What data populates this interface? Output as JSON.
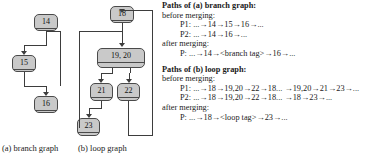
{
  "figure": {
    "branch_graph": {
      "caption": "(a) branch graph",
      "nodes": [
        {
          "id": "n14",
          "label": "14"
        },
        {
          "id": "n15",
          "label": "15"
        },
        {
          "id": "n16",
          "label": "16"
        }
      ]
    },
    "loop_graph": {
      "caption": "(b) loop graph",
      "nodes": [
        {
          "id": "n18",
          "label": "18"
        },
        {
          "id": "n1920",
          "label": "19, 20"
        },
        {
          "id": "n21",
          "label": "21"
        },
        {
          "id": "n22",
          "label": "22"
        },
        {
          "id": "n23",
          "label": "23"
        }
      ]
    }
  },
  "branch_section": {
    "heading": "Paths of (a) branch graph:",
    "before_label": "before merging:",
    "before_paths": [
      "P1: ...→14→15→16→...",
      "P2: ...→14→16→..."
    ],
    "after_label": "after merging:",
    "after_paths": [
      "P: ...→14→<branch tag>→16→..."
    ]
  },
  "loop_section": {
    "heading": "Paths of (b) loop graph:",
    "before_label": "before merging:",
    "before_paths": [
      "P1: ...→18→19,20→22→18... →19,20→21→23→...",
      "P2: ...→18→19,20→22→18... →18→23→..."
    ],
    "after_label": "after merging:",
    "after_paths": [
      "P: ...→18→<loop tag>→23→..."
    ]
  },
  "colors": {
    "node_fill": "#c9c9c9",
    "node_stroke": "#4a4a4a",
    "edge": "#3d3d3d",
    "text": "#1a1a1a",
    "background": "#ffffff"
  }
}
